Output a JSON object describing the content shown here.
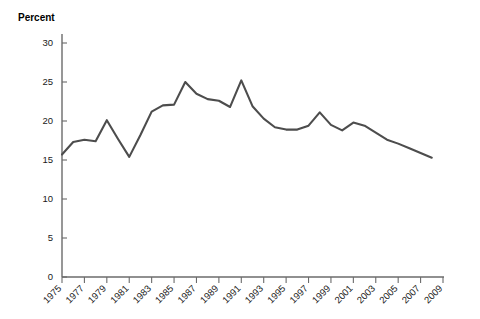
{
  "chart_data": {
    "type": "line",
    "title": "",
    "subtitle": "",
    "xlabel": "",
    "ylabel": "Percent",
    "ylim": [
      0,
      30
    ],
    "xlim": [
      1975,
      2009
    ],
    "yticks": [
      0,
      5,
      10,
      15,
      20,
      25,
      30
    ],
    "xticks": [
      1975,
      1977,
      1979,
      1981,
      1983,
      1985,
      1987,
      1989,
      1991,
      1993,
      1995,
      1997,
      1999,
      2001,
      2003,
      2005,
      2007,
      2009
    ],
    "grid": false,
    "legend": "none",
    "line_color": "#4d4d4d",
    "axis_color": "#6b6b6b",
    "x": [
      1975,
      1976,
      1977,
      1978,
      1979,
      1980,
      1981,
      1982,
      1983,
      1984,
      1985,
      1986,
      1987,
      1988,
      1989,
      1990,
      1991,
      1992,
      1993,
      1994,
      1995,
      1996,
      1997,
      1998,
      1999,
      2000,
      2001,
      2002,
      2003,
      2004,
      2005,
      2006,
      2007,
      2008
    ],
    "values": [
      15.7,
      17.3,
      17.6,
      17.4,
      20.1,
      17.7,
      15.4,
      18.2,
      21.2,
      22.0,
      22.1,
      25.0,
      23.5,
      22.8,
      22.6,
      21.8,
      25.2,
      21.9,
      20.3,
      19.2,
      18.9,
      18.9,
      19.4,
      21.1,
      19.5,
      18.8,
      19.8,
      19.4,
      18.5,
      17.6,
      17.1,
      16.5,
      15.9,
      15.3
    ],
    "series": [
      {
        "name": "Percent",
        "values": [
          15.7,
          17.3,
          17.6,
          17.4,
          20.1,
          17.7,
          15.4,
          18.2,
          21.2,
          22.0,
          22.1,
          25.0,
          23.5,
          22.8,
          22.6,
          21.8,
          25.2,
          21.9,
          20.3,
          19.2,
          18.9,
          18.9,
          19.4,
          21.1,
          19.5,
          18.8,
          19.8,
          19.4,
          18.5,
          17.6,
          17.1,
          16.5,
          15.9,
          15.3
        ]
      }
    ]
  },
  "axes": {
    "y_title": "Percent",
    "y_tick_labels": [
      "30",
      "25",
      "20",
      "15",
      "10",
      "5",
      "0"
    ],
    "x_tick_labels": [
      "1975",
      "1977",
      "1979",
      "1981",
      "1983",
      "1985",
      "1987",
      "1989",
      "1991",
      "1993",
      "1995",
      "1997",
      "1999",
      "2001",
      "2003",
      "2005",
      "2007",
      "2009"
    ]
  }
}
